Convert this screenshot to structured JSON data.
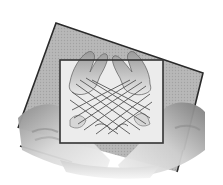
{
  "image": {
    "caption": "Grayscale illustration of two pairs of hands playing cat's cradle, with string lattice framed by a rectangle over a tilted gray square",
    "style": "grayscale halftone illustration",
    "colors": {
      "background": "#ffffff",
      "square_fill": "#b4b4b4",
      "square_edge": "#2a2a2a",
      "frame_fill": "#ececec",
      "frame_edge": "#333333",
      "hand_light": "#f2f2f2",
      "hand_mid": "#c8c8c8",
      "hand_dark": "#7a7a7a",
      "string": "#555555"
    },
    "tilted_square": {
      "corners": [
        [
          56,
          23
        ],
        [
          203,
          73
        ],
        [
          178,
          172
        ],
        [
          18,
          128
        ]
      ]
    },
    "inner_frame": {
      "x": 60,
      "y": 60,
      "width": 103,
      "height": 83
    }
  }
}
